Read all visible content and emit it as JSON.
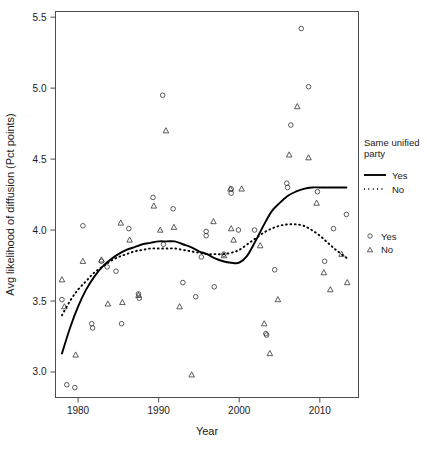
{
  "chart_data": {
    "type": "scatter",
    "title": "",
    "xlabel": "Year",
    "ylabel": "Avg likelihood of diffusion (Pct points)",
    "xlim": [
      1977.2,
      2014.8
    ],
    "ylim": [
      2.82,
      5.54
    ],
    "xticks": [
      1980,
      1990,
      2000,
      2010
    ],
    "yticks": [
      3.0,
      3.5,
      4.0,
      4.5,
      5.0,
      5.5
    ],
    "xtick_labels": [
      "1980",
      "1990",
      "2000",
      "2010"
    ],
    "ytick_labels": [
      "3.0",
      "3.5",
      "4.0",
      "4.5",
      "5.0",
      "5.5"
    ],
    "grid": false,
    "legend_position": "right",
    "series": [
      {
        "name": "Yes",
        "marker": "circle",
        "points": [
          [
            1978.0,
            3.51
          ],
          [
            1978.6,
            2.91
          ],
          [
            1979.6,
            2.89
          ],
          [
            1980.6,
            4.03
          ],
          [
            1981.7,
            3.34
          ],
          [
            1981.8,
            3.31
          ],
          [
            1982.9,
            3.78
          ],
          [
            1983.6,
            3.74
          ],
          [
            1984.7,
            3.71
          ],
          [
            1985.4,
            3.34
          ],
          [
            1986.3,
            4.01
          ],
          [
            1987.5,
            3.55
          ],
          [
            1987.6,
            3.52
          ],
          [
            1989.3,
            4.23
          ],
          [
            1990.5,
            4.95
          ],
          [
            1990.6,
            3.9
          ],
          [
            1991.8,
            4.15
          ],
          [
            1993.0,
            3.63
          ],
          [
            1994.6,
            3.53
          ],
          [
            1995.3,
            3.81
          ],
          [
            1995.9,
            3.99
          ],
          [
            1995.9,
            3.96
          ],
          [
            1996.9,
            3.6
          ],
          [
            1998.1,
            3.83
          ],
          [
            1999.0,
            4.29
          ],
          [
            1999.0,
            4.26
          ],
          [
            1999.9,
            4.0
          ],
          [
            2001.9,
            4.0
          ],
          [
            2003.3,
            3.27
          ],
          [
            2003.4,
            3.26
          ],
          [
            2004.4,
            3.72
          ],
          [
            2005.9,
            4.33
          ],
          [
            2006.0,
            4.3
          ],
          [
            2006.4,
            4.74
          ],
          [
            2007.7,
            5.42
          ],
          [
            2008.6,
            5.01
          ],
          [
            2009.7,
            4.27
          ],
          [
            2010.6,
            3.78
          ],
          [
            2011.7,
            4.01
          ],
          [
            2013.3,
            4.11
          ]
        ]
      },
      {
        "name": "No",
        "marker": "triangle",
        "points": [
          [
            1978.0,
            3.65
          ],
          [
            1978.3,
            3.46
          ],
          [
            1979.7,
            3.12
          ],
          [
            1980.6,
            3.78
          ],
          [
            1982.9,
            3.79
          ],
          [
            1983.7,
            3.48
          ],
          [
            1985.3,
            4.05
          ],
          [
            1985.5,
            3.49
          ],
          [
            1986.4,
            3.93
          ],
          [
            1987.5,
            3.54
          ],
          [
            1989.4,
            4.17
          ],
          [
            1990.2,
            4.0
          ],
          [
            1990.9,
            4.7
          ],
          [
            1991.9,
            4.02
          ],
          [
            1992.6,
            3.46
          ],
          [
            1994.1,
            2.98
          ],
          [
            1996.8,
            4.06
          ],
          [
            1998.1,
            3.82
          ],
          [
            1998.9,
            4.29
          ],
          [
            1999.0,
            4.01
          ],
          [
            1999.3,
            3.93
          ],
          [
            2000.3,
            4.29
          ],
          [
            2002.6,
            3.89
          ],
          [
            2003.1,
            3.34
          ],
          [
            2003.8,
            3.13
          ],
          [
            2004.8,
            3.51
          ],
          [
            2006.2,
            4.53
          ],
          [
            2007.2,
            4.87
          ],
          [
            2008.6,
            4.51
          ],
          [
            2009.6,
            4.19
          ],
          [
            2010.5,
            3.7
          ],
          [
            2011.3,
            3.58
          ],
          [
            2012.7,
            3.83
          ],
          [
            2013.4,
            3.63
          ]
        ]
      }
    ],
    "fitted_curves": [
      {
        "name": "Yes",
        "style": "solid",
        "points": [
          [
            1978.0,
            3.13
          ],
          [
            1979.0,
            3.31
          ],
          [
            1980.0,
            3.46
          ],
          [
            1981.0,
            3.58
          ],
          [
            1982.0,
            3.67
          ],
          [
            1983.0,
            3.74
          ],
          [
            1984.0,
            3.79
          ],
          [
            1985.0,
            3.83
          ],
          [
            1986.0,
            3.86
          ],
          [
            1987.0,
            3.88
          ],
          [
            1988.0,
            3.9
          ],
          [
            1989.0,
            3.91
          ],
          [
            1990.0,
            3.92
          ],
          [
            1991.0,
            3.92
          ],
          [
            1992.0,
            3.92
          ],
          [
            1993.0,
            3.9
          ],
          [
            1994.0,
            3.88
          ],
          [
            1995.0,
            3.85
          ],
          [
            1996.0,
            3.83
          ],
          [
            1997.0,
            3.8
          ],
          [
            1998.0,
            3.78
          ],
          [
            1999.0,
            3.77
          ],
          [
            2000.0,
            3.77
          ],
          [
            2001.0,
            3.82
          ],
          [
            2002.0,
            3.92
          ],
          [
            2003.0,
            4.03
          ],
          [
            2004.0,
            4.13
          ],
          [
            2005.0,
            4.19
          ],
          [
            2006.0,
            4.24
          ],
          [
            2007.0,
            4.27
          ],
          [
            2008.0,
            4.29
          ],
          [
            2009.0,
            4.3
          ],
          [
            2010.0,
            4.3
          ],
          [
            2011.0,
            4.3
          ],
          [
            2012.0,
            4.3
          ],
          [
            2013.3,
            4.3
          ]
        ]
      },
      {
        "name": "No",
        "style": "dotted",
        "points": [
          [
            1978.0,
            3.4
          ],
          [
            1979.0,
            3.5
          ],
          [
            1980.0,
            3.58
          ],
          [
            1981.0,
            3.64
          ],
          [
            1982.0,
            3.7
          ],
          [
            1983.0,
            3.74
          ],
          [
            1984.0,
            3.78
          ],
          [
            1985.0,
            3.81
          ],
          [
            1986.0,
            3.83
          ],
          [
            1987.0,
            3.85
          ],
          [
            1988.0,
            3.86
          ],
          [
            1989.0,
            3.87
          ],
          [
            1990.0,
            3.87
          ],
          [
            1991.0,
            3.87
          ],
          [
            1992.0,
            3.87
          ],
          [
            1993.0,
            3.86
          ],
          [
            1994.0,
            3.85
          ],
          [
            1995.0,
            3.84
          ],
          [
            1996.0,
            3.83
          ],
          [
            1997.0,
            3.83
          ],
          [
            1998.0,
            3.83
          ],
          [
            1999.0,
            3.84
          ],
          [
            2000.0,
            3.86
          ],
          [
            2001.0,
            3.9
          ],
          [
            2002.0,
            3.94
          ],
          [
            2003.0,
            3.98
          ],
          [
            2004.0,
            4.01
          ],
          [
            2005.0,
            4.03
          ],
          [
            2006.0,
            4.04
          ],
          [
            2007.0,
            4.04
          ],
          [
            2008.0,
            4.03
          ],
          [
            2009.0,
            4.0
          ],
          [
            2010.0,
            3.96
          ],
          [
            2011.0,
            3.91
          ],
          [
            2012.0,
            3.86
          ],
          [
            2013.4,
            3.8
          ]
        ]
      }
    ]
  },
  "legend": {
    "title_line1": "Same unified",
    "title_line2": "party",
    "line_entries": [
      {
        "label": "Yes",
        "style": "solid"
      },
      {
        "label": "No",
        "style": "dotted"
      }
    ],
    "point_entries": [
      {
        "label": "Yes",
        "marker": "circle"
      },
      {
        "label": "No",
        "marker": "triangle"
      }
    ]
  }
}
